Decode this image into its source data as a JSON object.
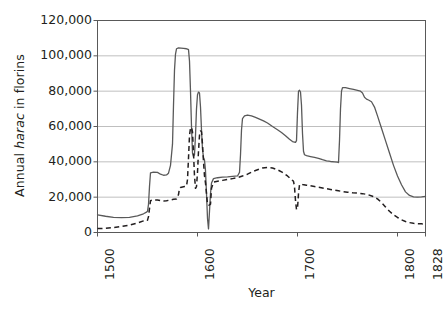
{
  "chart_data": {
    "type": "line",
    "title": "",
    "xlabel": "Year",
    "ylabel": "Annual harac in florins",
    "ylabel_italic_word": "harac",
    "xlim": [
      1500,
      1828
    ],
    "ylim": [
      0,
      120000
    ],
    "grid": "horizontal",
    "legend_position": "none",
    "y_ticks": [
      "120,000",
      "100,000",
      "80,000",
      "60,000",
      "40,000",
      "20,000",
      "0"
    ],
    "y_tick_values": [
      120000,
      100000,
      80000,
      60000,
      40000,
      20000,
      0
    ],
    "x_ticks": [
      "1500",
      "1600",
      "1700",
      "1800",
      "1828"
    ],
    "x_tick_values": [
      1500,
      1600,
      1700,
      1800,
      1828
    ],
    "series": [
      {
        "name": "nominal-harac",
        "style": "solid",
        "color": "#595959",
        "points": [
          [
            1500,
            10000
          ],
          [
            1508,
            9200
          ],
          [
            1516,
            8600
          ],
          [
            1524,
            8400
          ],
          [
            1532,
            8600
          ],
          [
            1540,
            9400
          ],
          [
            1546,
            10600
          ],
          [
            1549,
            11500
          ],
          [
            1550,
            12000
          ],
          [
            1551,
            16000
          ],
          [
            1552,
            26000
          ],
          [
            1553,
            33800
          ],
          [
            1556,
            34200
          ],
          [
            1560,
            34000
          ],
          [
            1563,
            33000
          ],
          [
            1566,
            32400
          ],
          [
            1569,
            32600
          ],
          [
            1571,
            33600
          ],
          [
            1573,
            38000
          ],
          [
            1575,
            50000
          ],
          [
            1576,
            72000
          ],
          [
            1577,
            92000
          ],
          [
            1578,
            101000
          ],
          [
            1579,
            104000
          ],
          [
            1581,
            104500
          ],
          [
            1586,
            104200
          ],
          [
            1589,
            104000
          ],
          [
            1590,
            103800
          ],
          [
            1591,
            103500
          ],
          [
            1592,
            97000
          ],
          [
            1593,
            80000
          ],
          [
            1594,
            60000
          ],
          [
            1595,
            45000
          ],
          [
            1596,
            43000
          ],
          [
            1597,
            44000
          ],
          [
            1598,
            55000
          ],
          [
            1599,
            70000
          ],
          [
            1600,
            78000
          ],
          [
            1601,
            79500
          ],
          [
            1602,
            79000
          ],
          [
            1603,
            71000
          ],
          [
            1604,
            58000
          ],
          [
            1605,
            47000
          ],
          [
            1606,
            42500
          ],
          [
            1607,
            41000
          ],
          [
            1608,
            35000
          ],
          [
            1609,
            22000
          ],
          [
            1610,
            8000
          ],
          [
            1611,
            2000
          ],
          [
            1612,
            12000
          ],
          [
            1613,
            22000
          ],
          [
            1614,
            28000
          ],
          [
            1616,
            30500
          ],
          [
            1620,
            31000
          ],
          [
            1625,
            31300
          ],
          [
            1630,
            31500
          ],
          [
            1635,
            31800
          ],
          [
            1640,
            32000
          ],
          [
            1642,
            34000
          ],
          [
            1643,
            44000
          ],
          [
            1644,
            58000
          ],
          [
            1645,
            64500
          ],
          [
            1647,
            66000
          ],
          [
            1650,
            66500
          ],
          [
            1654,
            66000
          ],
          [
            1658,
            65200
          ],
          [
            1662,
            64200
          ],
          [
            1666,
            63200
          ],
          [
            1670,
            62000
          ],
          [
            1675,
            60000
          ],
          [
            1680,
            58200
          ],
          [
            1684,
            56600
          ],
          [
            1688,
            54800
          ],
          [
            1692,
            52800
          ],
          [
            1695,
            51500
          ],
          [
            1697,
            51200
          ],
          [
            1698,
            51000
          ],
          [
            1699,
            52000
          ],
          [
            1700,
            68000
          ],
          [
            1701,
            80000
          ],
          [
            1702,
            80500
          ],
          [
            1703,
            79500
          ],
          [
            1704,
            72000
          ],
          [
            1705,
            56000
          ],
          [
            1706,
            46000
          ],
          [
            1707,
            44000
          ],
          [
            1709,
            43500
          ],
          [
            1713,
            43000
          ],
          [
            1717,
            42500
          ],
          [
            1721,
            42000
          ],
          [
            1725,
            41200
          ],
          [
            1729,
            40600
          ],
          [
            1733,
            40200
          ],
          [
            1737,
            40000
          ],
          [
            1740,
            39800
          ],
          [
            1741,
            39600
          ],
          [
            1742,
            52000
          ],
          [
            1743,
            70000
          ],
          [
            1744,
            80000
          ],
          [
            1745,
            82000
          ],
          [
            1748,
            82000
          ],
          [
            1752,
            81500
          ],
          [
            1756,
            81000
          ],
          [
            1760,
            80500
          ],
          [
            1763,
            80000
          ],
          [
            1765,
            79000
          ],
          [
            1767,
            76500
          ],
          [
            1769,
            75500
          ],
          [
            1771,
            75000
          ],
          [
            1774,
            74000
          ],
          [
            1777,
            71000
          ],
          [
            1780,
            66000
          ],
          [
            1784,
            59000
          ],
          [
            1788,
            52000
          ],
          [
            1792,
            45000
          ],
          [
            1796,
            38000
          ],
          [
            1800,
            32000
          ],
          [
            1804,
            27000
          ],
          [
            1808,
            23000
          ],
          [
            1812,
            21000
          ],
          [
            1816,
            20200
          ],
          [
            1820,
            20000
          ],
          [
            1824,
            20200
          ],
          [
            1828,
            20500
          ]
        ]
      },
      {
        "name": "real-harac",
        "style": "dashed",
        "color": "#231f20",
        "points": [
          [
            1500,
            2200
          ],
          [
            1508,
            2400
          ],
          [
            1516,
            2800
          ],
          [
            1524,
            3400
          ],
          [
            1532,
            4200
          ],
          [
            1540,
            5400
          ],
          [
            1546,
            6600
          ],
          [
            1549,
            7200
          ],
          [
            1550,
            7000
          ],
          [
            1551,
            9000
          ],
          [
            1552,
            13500
          ],
          [
            1553,
            18000
          ],
          [
            1556,
            18500
          ],
          [
            1560,
            18400
          ],
          [
            1563,
            18000
          ],
          [
            1566,
            17800
          ],
          [
            1569,
            18000
          ],
          [
            1571,
            18200
          ],
          [
            1573,
            18400
          ],
          [
            1576,
            18800
          ],
          [
            1579,
            19000
          ],
          [
            1581,
            21500
          ],
          [
            1582,
            25000
          ],
          [
            1583,
            25500
          ],
          [
            1585,
            25800
          ],
          [
            1587,
            26000
          ],
          [
            1589,
            26200
          ],
          [
            1590,
            30000
          ],
          [
            1591,
            42000
          ],
          [
            1592,
            55000
          ],
          [
            1593,
            59000
          ],
          [
            1594,
            59500
          ],
          [
            1595,
            57000
          ],
          [
            1596,
            45000
          ],
          [
            1597,
            32000
          ],
          [
            1598,
            25000
          ],
          [
            1599,
            26000
          ],
          [
            1600,
            34000
          ],
          [
            1601,
            46000
          ],
          [
            1602,
            55000
          ],
          [
            1603,
            57500
          ],
          [
            1604,
            57000
          ],
          [
            1605,
            50000
          ],
          [
            1606,
            40000
          ],
          [
            1607,
            32000
          ],
          [
            1608,
            28000
          ],
          [
            1609,
            22000
          ],
          [
            1610,
            16000
          ],
          [
            1611,
            15500
          ],
          [
            1612,
            15600
          ],
          [
            1613,
            16000
          ],
          [
            1614,
            25000
          ],
          [
            1616,
            28500
          ],
          [
            1620,
            29000
          ],
          [
            1625,
            29500
          ],
          [
            1630,
            30000
          ],
          [
            1635,
            30500
          ],
          [
            1640,
            31000
          ],
          [
            1645,
            32000
          ],
          [
            1650,
            33000
          ],
          [
            1655,
            34500
          ],
          [
            1660,
            35500
          ],
          [
            1665,
            36500
          ],
          [
            1670,
            36800
          ],
          [
            1675,
            36500
          ],
          [
            1680,
            35500
          ],
          [
            1685,
            34000
          ],
          [
            1690,
            32000
          ],
          [
            1693,
            30500
          ],
          [
            1695,
            29500
          ],
          [
            1696,
            29000
          ],
          [
            1697,
            26000
          ],
          [
            1698,
            18000
          ],
          [
            1699,
            13000
          ],
          [
            1700,
            13500
          ],
          [
            1701,
            22000
          ],
          [
            1702,
            27000
          ],
          [
            1703,
            27500
          ],
          [
            1705,
            27200
          ],
          [
            1709,
            26800
          ],
          [
            1713,
            26400
          ],
          [
            1717,
            26000
          ],
          [
            1721,
            25600
          ],
          [
            1725,
            25200
          ],
          [
            1729,
            24800
          ],
          [
            1733,
            24400
          ],
          [
            1737,
            24000
          ],
          [
            1741,
            23600
          ],
          [
            1745,
            23200
          ],
          [
            1750,
            22800
          ],
          [
            1755,
            22500
          ],
          [
            1760,
            22300
          ],
          [
            1765,
            22000
          ],
          [
            1770,
            21500
          ],
          [
            1775,
            20500
          ],
          [
            1780,
            19000
          ],
          [
            1784,
            17000
          ],
          [
            1788,
            14500
          ],
          [
            1792,
            12000
          ],
          [
            1796,
            10000
          ],
          [
            1800,
            8500
          ],
          [
            1804,
            7200
          ],
          [
            1808,
            6200
          ],
          [
            1812,
            5600
          ],
          [
            1816,
            5200
          ],
          [
            1820,
            5000
          ],
          [
            1824,
            4900
          ],
          [
            1828,
            4800
          ]
        ]
      }
    ],
    "colors": {
      "axis": "#595959",
      "grid": "#bfbfbf",
      "text": "#231f20",
      "solid_line": "#595959",
      "dashed_line": "#231f20",
      "background": "#ffffff"
    }
  }
}
